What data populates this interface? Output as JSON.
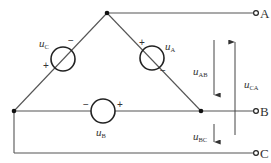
{
  "diagram": {
    "title": "",
    "type": "three-phase delta-connected voltage sources",
    "colors": {
      "wire": "#555555",
      "source": "#222222",
      "text": "#333333"
    },
    "terminals": [
      {
        "id": "A",
        "label": "A"
      },
      {
        "id": "B",
        "label": "B"
      },
      {
        "id": "C",
        "label": "C"
      }
    ],
    "sources": [
      {
        "id": "uC",
        "var": "u",
        "sub": "C",
        "plus": "+",
        "minus": "−"
      },
      {
        "id": "uA",
        "var": "u",
        "sub": "A",
        "plus": "+",
        "minus": "−"
      },
      {
        "id": "uB",
        "var": "u",
        "sub": "B",
        "plus": "+",
        "minus": "−"
      }
    ],
    "voltages": [
      {
        "id": "uAB",
        "var": "u",
        "sub": "AB",
        "direction": "down"
      },
      {
        "id": "uCA",
        "var": "u",
        "sub": "CA",
        "direction": "up"
      },
      {
        "id": "uBC",
        "var": "u",
        "sub": "BC",
        "direction": "down"
      }
    ]
  }
}
